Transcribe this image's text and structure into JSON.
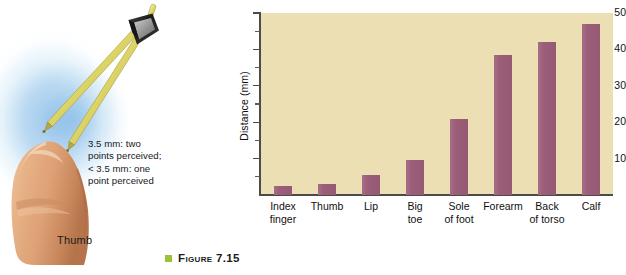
{
  "illustration": {
    "annotation": "3.5 mm: two points perceived; < 3.5 mm: one point perceived",
    "annotation_lines": [
      "3.5 mm: two",
      "points perceived;",
      "< 3.5 mm: one",
      "point perceived"
    ],
    "thumb_label": "Thumb",
    "caliper_icon": "two-point-discrimination-caliper-icon",
    "thumb_icon": "thumb-illustration-icon",
    "colors": {
      "glow": "#a8cde9",
      "skin": "#e5a877",
      "caliper_arm": "#e6e07a",
      "caliper_hinge": "#2b2b2b"
    }
  },
  "caption": {
    "bullet_color": "#9ec13c",
    "text": "Figure 7.15"
  },
  "chart_data": {
    "type": "bar",
    "title": "",
    "xlabel": "",
    "ylabel": "Distance (mm)",
    "ylim": [
      0,
      50
    ],
    "yticks": [
      10,
      20,
      30,
      40,
      50
    ],
    "ytick_labels": [
      "10",
      "20",
      "30",
      "40",
      "50"
    ],
    "minor_yticks": [
      5,
      15,
      25,
      35,
      45
    ],
    "grid": false,
    "legend": null,
    "plot_background": "#ecdfb4",
    "bar_color": "#9c5e79",
    "axis_color": "#4b4b4b",
    "categories": [
      "Index finger",
      "Thumb",
      "Lip",
      "Big toe",
      "Sole of foot",
      "Forearm",
      "Back of torso",
      "Calf"
    ],
    "category_lines": [
      [
        "Index",
        "finger"
      ],
      [
        "Thumb",
        ""
      ],
      [
        "Lip",
        ""
      ],
      [
        "Big",
        "toe"
      ],
      [
        "Sole",
        "of foot"
      ],
      [
        "Forearm",
        ""
      ],
      [
        "Back",
        "of torso"
      ],
      [
        "Calf",
        ""
      ]
    ],
    "values": [
      2.5,
      3,
      5.5,
      9.5,
      21,
      38.5,
      42,
      47
    ]
  }
}
